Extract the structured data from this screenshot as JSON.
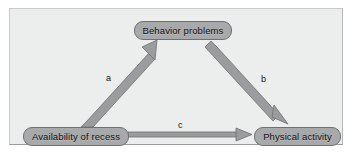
{
  "diagram": {
    "background_color": "#eceded",
    "node_fill": "#a8a9aa",
    "node_stroke": "#6f7071",
    "arrow_color": "#9b9c9d",
    "arrow_stroke": "#6f7071",
    "nodes": [
      {
        "id": "behavior-problems",
        "label": "Behavior problems",
        "x": 133,
        "y": 20,
        "width": 98,
        "height": 19
      },
      {
        "id": "availability-of-recess",
        "label": "Availability of recess",
        "x": 22,
        "y": 126,
        "width": 106,
        "height": 19
      },
      {
        "id": "physical-activity",
        "label": "Physical activity",
        "x": 253,
        "y": 126,
        "width": 87,
        "height": 19
      }
    ],
    "edges": [
      {
        "id": "path-a",
        "label": "a",
        "from": "availability-of-recess",
        "to": "behavior-problems",
        "label_x": 105,
        "label_y": 73
      },
      {
        "id": "path-b",
        "label": "b",
        "from": "behavior-problems",
        "to": "physical-activity",
        "label_x": 260,
        "label_y": 74
      },
      {
        "id": "path-c",
        "label": "c",
        "from": "availability-of-recess",
        "to": "physical-activity",
        "label_x": 177,
        "label_y": 120
      }
    ]
  }
}
